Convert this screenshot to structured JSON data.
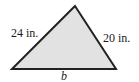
{
  "diagram": {
    "type": "triangle",
    "fill_color": "#e2e2e2",
    "stroke_color": "#222222",
    "vertices": {
      "apex": [
        75,
        6
      ],
      "bottom_left": [
        12,
        69
      ],
      "bottom_right": [
        116,
        69
      ]
    },
    "labels": {
      "left_side": "24 in.",
      "right_side": "20 in.",
      "base": "b"
    }
  }
}
